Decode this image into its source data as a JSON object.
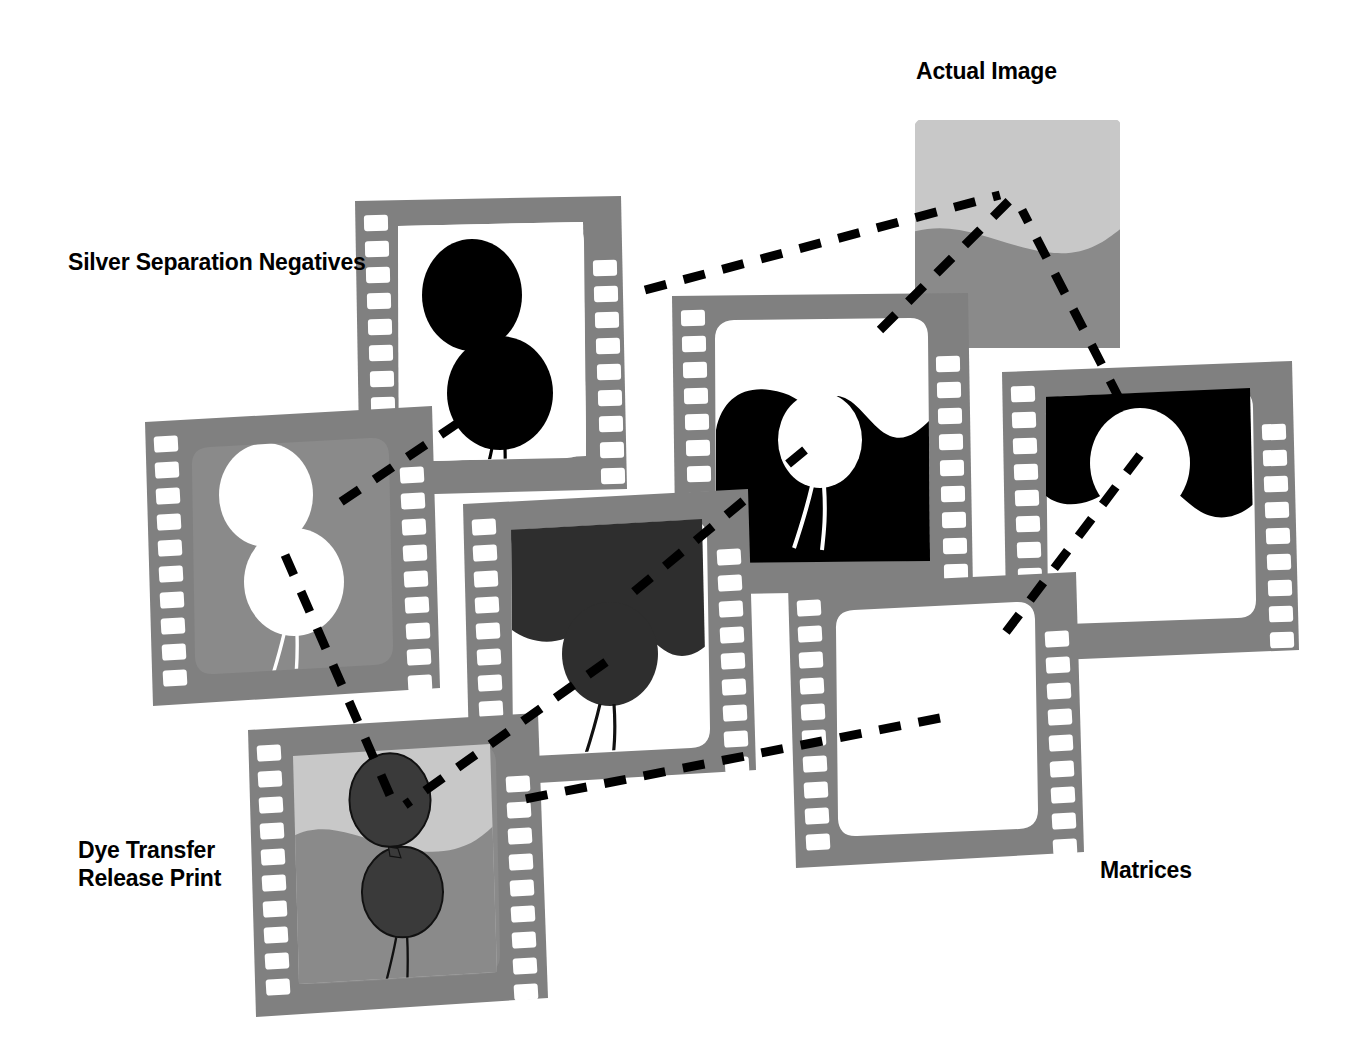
{
  "diagram": {
    "background_color": "#FFFFFF",
    "labels": {
      "silver_separation_negatives": "Silver Separation Negatives",
      "actual_image": "Actual Image",
      "dye_transfer_release_print": "Dye Transfer\nRelease Print",
      "matrices": "Matrices"
    },
    "palette": {
      "film_strip_gray": "#808080",
      "film_strip_shadow": "#6E6E6E",
      "perforation_white": "#FFFFFF",
      "frame_white": "#FFFFFF",
      "sky_light_gray": "#C8C8C8",
      "ground_mid_gray": "#8A8A8A",
      "matrix_mid_gray": "#8A8A8A",
      "matrix_dark_gray": "#2E2E2E",
      "balloon_dark": "#3A3A3A",
      "negative_black": "#000000",
      "connector_black": "#000000",
      "text_black": "#000000"
    },
    "connector_style": {
      "type": "dashed",
      "color": "#000000",
      "width_px": 9,
      "dash": "22 18"
    },
    "nodes": [
      {
        "id": "actual-image",
        "name": "Actual Image",
        "group": "actual-image",
        "kind": "photo",
        "description": "Color photograph of two balloons against a light sky over a mid-gray ground",
        "contents": {
          "sky": "#C8C8C8",
          "ground": "#8A8A8A",
          "balloons": "#3A3A3A",
          "balloon_count": 2
        }
      },
      {
        "id": "negative-1",
        "name": "Silver Separation Negative 1",
        "group": "silver-separation-negatives",
        "kind": "film-strip",
        "description": "Both balloons rendered as solid black on a clear white field",
        "contents": {
          "background": "#FFFFFF",
          "subject": "#000000"
        }
      },
      {
        "id": "negative-2",
        "name": "Silver Separation Negative 2",
        "group": "silver-separation-negatives",
        "kind": "film-strip",
        "description": "Black ground mass with a single white balloon silhouette",
        "contents": {
          "background": "#FFFFFF",
          "subject": "#000000"
        }
      },
      {
        "id": "negative-3",
        "name": "Silver Separation Negative 3",
        "group": "silver-separation-negatives",
        "kind": "film-strip",
        "description": "Black sky band across the top with a white balloon silhouette",
        "contents": {
          "background": "#FFFFFF",
          "subject": "#000000"
        }
      },
      {
        "id": "matrix-1",
        "name": "Matrix 1",
        "group": "matrices",
        "kind": "film-strip",
        "description": "Mid-gray field with two white balloon shapes",
        "contents": {
          "background": "#8A8A8A",
          "subject": "#FFFFFF"
        }
      },
      {
        "id": "matrix-2",
        "name": "Matrix 2",
        "group": "matrices",
        "kind": "film-strip",
        "description": "Dark gray sky mass and a dark gray lower balloon on white",
        "contents": {
          "background": "#FFFFFF",
          "subject": "#2E2E2E"
        }
      },
      {
        "id": "matrix-3",
        "name": "Matrix 3",
        "group": "matrices",
        "kind": "film-strip",
        "description": "Blank white frame",
        "contents": {
          "background": "#FFFFFF",
          "subject": "none"
        }
      },
      {
        "id": "dye-transfer-print",
        "name": "Dye Transfer Release Print",
        "group": "dye-transfer-release-print",
        "kind": "film-strip",
        "description": "Final composited frame: light sky, mid-gray ground, two dark balloons",
        "contents": {
          "sky": "#C8C8C8",
          "ground": "#8A8A8A",
          "balloons": "#3A3A3A",
          "balloon_count": 2
        }
      }
    ],
    "connectors": [
      {
        "id": "c1",
        "from": "negative-1",
        "to": "actual-image"
      },
      {
        "id": "c2",
        "from": "negative-2",
        "to": "actual-image"
      },
      {
        "id": "c3",
        "from": "negative-3",
        "to": "actual-image"
      },
      {
        "id": "c4",
        "from": "negative-1",
        "to": "matrix-1"
      },
      {
        "id": "c5",
        "from": "negative-2",
        "to": "matrix-2"
      },
      {
        "id": "c6",
        "from": "negative-3",
        "to": "matrix-3"
      },
      {
        "id": "c7",
        "from": "matrix-1",
        "to": "dye-transfer-print"
      },
      {
        "id": "c8",
        "from": "matrix-2",
        "to": "dye-transfer-print"
      },
      {
        "id": "c9",
        "from": "matrix-3",
        "to": "dye-transfer-print"
      }
    ]
  }
}
